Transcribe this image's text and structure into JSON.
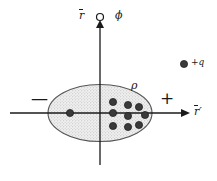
{
  "figure": {
    "background_color": "#ffffff",
    "stroke_color": "#1a1a1a",
    "fill_color": "#ebebeb",
    "dot_color": "#3a3a3a",
    "width": 217,
    "height": 181
  },
  "labels": {
    "vertical_axis": "r",
    "vertical_axis_overbar": true,
    "azimuth": "ϕ",
    "origin_marker": "open-circle",
    "horizontal_axis": "r",
    "horizontal_axis_prime": "′",
    "horizontal_axis_overbar": true,
    "charge_density": "ρ",
    "point_charge": "+q",
    "minus_sign": "—",
    "plus_sign": "+"
  },
  "geometry": {
    "vertical_axis": {
      "x": 100,
      "y_top": 22,
      "y_bottom": 165
    },
    "horizontal_axis": {
      "y": 113,
      "x_left": 10,
      "x_right": 185
    },
    "ellipse": {
      "cx": 100,
      "cy": 113,
      "rx": 52,
      "ry": 28.5
    },
    "origin_circle": {
      "cx": 100,
      "cy": 17,
      "r": 3.5
    },
    "point_charge_dot": {
      "cx": 184,
      "cy": 64,
      "r": 3.6
    }
  },
  "charge_dots": [
    {
      "cx": 70,
      "cy": 113,
      "r": 3.6
    },
    {
      "cx": 113,
      "cy": 102,
      "r": 3.6
    },
    {
      "cx": 113,
      "cy": 113,
      "r": 3.6
    },
    {
      "cx": 113,
      "cy": 126,
      "r": 3.6
    },
    {
      "cx": 128,
      "cy": 105,
      "r": 3.6
    },
    {
      "cx": 128,
      "cy": 116,
      "r": 3.6
    },
    {
      "cx": 128,
      "cy": 127,
      "r": 3.6
    },
    {
      "cx": 139,
      "cy": 107,
      "r": 3.6
    },
    {
      "cx": 139,
      "cy": 125,
      "r": 3.6
    },
    {
      "cx": 145,
      "cy": 115,
      "r": 3.6
    }
  ],
  "label_positions": {
    "vertical_axis": {
      "x": 79,
      "y": 10
    },
    "azimuth": {
      "x": 115,
      "y": 10
    },
    "charge_density": {
      "x": 131,
      "y": 80
    },
    "horizontal_axis": {
      "x": 194,
      "y": 106
    },
    "point_charge": {
      "x": 191,
      "y": 58
    },
    "minus_sign": {
      "x": 31,
      "y": 90
    },
    "plus_sign": {
      "x": 160,
      "y": 90
    }
  }
}
